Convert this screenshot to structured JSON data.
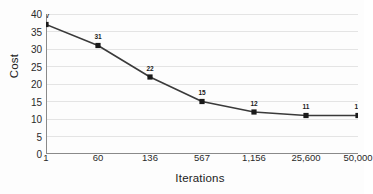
{
  "chart_data": {
    "type": "line",
    "title": "",
    "xlabel": "Iterations",
    "ylabel": "Cost",
    "categories": [
      "1",
      "60",
      "136",
      "567",
      "1,156",
      "25,600",
      "50,000"
    ],
    "values": [
      37,
      31,
      22,
      15,
      12,
      11,
      11
    ],
    "data_labels": [
      "37",
      "31",
      "22",
      "15",
      "12",
      "11",
      "11"
    ],
    "series": [
      {
        "name": "Cost",
        "values": [
          37,
          31,
          22,
          15,
          12,
          11,
          11
        ]
      }
    ],
    "ylim": [
      0,
      40
    ],
    "yticks": [
      0,
      5,
      10,
      15,
      20,
      25,
      30,
      35,
      40
    ],
    "ytick_labels": [
      "0",
      "5",
      "10",
      "15",
      "20",
      "25",
      "30",
      "35",
      "40"
    ],
    "grid": true,
    "grid_axis": "y",
    "legend": false,
    "legend_position": "none",
    "marker": "square",
    "colors": {
      "line": "#3a3a3a",
      "marker": "#1a1a1a",
      "grid": "#e4e4e4",
      "axis": "#8a8a8a",
      "text": "#2a2a2a"
    }
  }
}
